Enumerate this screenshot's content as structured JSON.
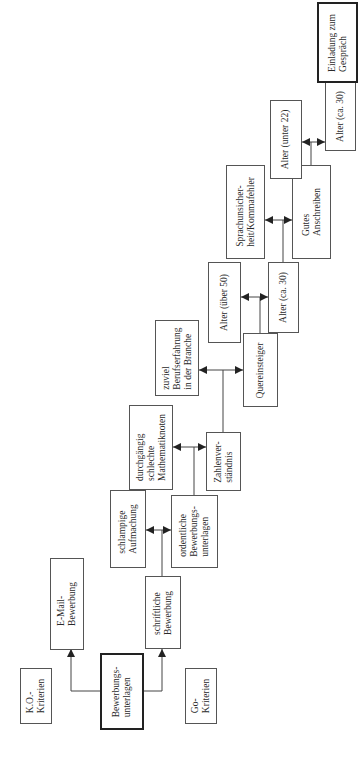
{
  "diagram": {
    "orientation": "rotated-90-ccw",
    "colors": {
      "line": "#444444",
      "box_border": "#555555",
      "background": "#ffffff"
    },
    "nodes": [
      {
        "id": "ko",
        "label": "K.O.-\nKriterien",
        "x": 20,
        "y": 668,
        "w": 32,
        "h": 56,
        "thick": false
      },
      {
        "id": "unterlagen",
        "label": "Bewerbungs-\nunterlagen",
        "x": 100,
        "y": 653,
        "w": 44,
        "h": 77,
        "thick": true
      },
      {
        "id": "email",
        "label": "E-Mail-\nBewerbung",
        "x": 50,
        "y": 558,
        "w": 34,
        "h": 92,
        "thick": false
      },
      {
        "id": "schriftlich",
        "label": "schriftliche\nBewerbung",
        "x": 145,
        "y": 576,
        "w": 36,
        "h": 73,
        "thick": false
      },
      {
        "id": "go",
        "label": "Go-\nKriterien",
        "x": 185,
        "y": 668,
        "w": 32,
        "h": 56,
        "thick": false
      },
      {
        "id": "schlampig",
        "label": "schlampige\nAufmachung",
        "x": 110,
        "y": 490,
        "w": 36,
        "h": 78,
        "thick": false
      },
      {
        "id": "ordentlich",
        "label": "ordentliche\nBewerbungs-\nunterlagen",
        "x": 171,
        "y": 495,
        "w": 47,
        "h": 73,
        "thick": false
      },
      {
        "id": "mathe",
        "label": "durchgängig\nschlechte\nMathematiknoten",
        "x": 129,
        "y": 405,
        "w": 44,
        "h": 85,
        "thick": false
      },
      {
        "id": "zahlen",
        "label": "Zahlenver-\nständnis",
        "x": 206,
        "y": 432,
        "w": 35,
        "h": 59,
        "thick": false
      },
      {
        "id": "beruf",
        "label": "zuviel\nBerufserfahrung\nin der Branche",
        "x": 155,
        "y": 320,
        "w": 44,
        "h": 76,
        "thick": false
      },
      {
        "id": "quer",
        "label": "Quereinsteiger",
        "x": 243,
        "y": 333,
        "w": 35,
        "h": 74,
        "thick": false
      },
      {
        "id": "alter50",
        "label": "Alter (über 50)",
        "x": 208,
        "y": 262,
        "w": 33,
        "h": 81,
        "thick": false
      },
      {
        "id": "alter30a",
        "label": "Alter (ca. 30)",
        "x": 268,
        "y": 262,
        "w": 31,
        "h": 71,
        "thick": false
      },
      {
        "id": "sprache",
        "label": "Sprachunsicher-\nheit/Kommafehler",
        "x": 226,
        "y": 165,
        "w": 39,
        "h": 94,
        "thick": false
      },
      {
        "id": "anschreiben",
        "label": "Gutes\nAnschreiben",
        "x": 292,
        "y": 165,
        "w": 39,
        "h": 94,
        "thick": false
      },
      {
        "id": "alter22",
        "label": "Alter (unter 22)",
        "x": 270,
        "y": 100,
        "w": 32,
        "h": 79,
        "thick": false
      },
      {
        "id": "alter30b",
        "label": "Alter (ca. 30)",
        "x": 325,
        "y": 82,
        "w": 31,
        "h": 69,
        "thick": false
      },
      {
        "id": "einladung",
        "label": "Einladung zum\nGespräch",
        "x": 317,
        "y": 2,
        "w": 41,
        "h": 81,
        "thick": true
      }
    ],
    "edges": [
      {
        "from": "unterlagen",
        "to": "email",
        "points": [
          [
            100,
            691
          ],
          [
            71,
            691
          ],
          [
            71,
            649
          ]
        ]
      },
      {
        "from": "unterlagen",
        "to": "schriftlich",
        "points": [
          [
            143,
            691
          ],
          [
            162,
            691
          ],
          [
            162,
            649
          ]
        ]
      },
      {
        "from": "schriftlich",
        "to": [
          "schlampig",
          "ordentlich"
        ],
        "stem": [
          [
            162,
            576
          ],
          [
            162,
            530
          ]
        ],
        "bar": [
          [
            146,
            530
          ],
          [
            171,
            530
          ]
        ]
      },
      {
        "from": "ordentlich",
        "to": [
          "mathe",
          "zahlen"
        ],
        "stem": [
          [
            194,
            495
          ],
          [
            194,
            447
          ]
        ],
        "bar": [
          [
            173,
            447
          ],
          [
            206,
            447
          ]
        ]
      },
      {
        "from": "zahlen",
        "to": [
          "beruf",
          "quer"
        ],
        "stem": [
          [
            223,
            432
          ],
          [
            223,
            370
          ]
        ],
        "bar": [
          [
            199,
            370
          ],
          [
            243,
            370
          ]
        ]
      },
      {
        "from": "quer",
        "to": [
          "alter50",
          "alter30a"
        ],
        "stem": [
          [
            260,
            333
          ],
          [
            260,
            297
          ]
        ],
        "bar": [
          [
            241,
            297
          ],
          [
            268,
            297
          ]
        ]
      },
      {
        "from": "alter30a",
        "to": [
          "sprache",
          "anschreiben"
        ],
        "stem": [
          [
            283,
            262
          ],
          [
            283,
            220
          ]
        ],
        "bar": [
          [
            265,
            220
          ],
          [
            292,
            220
          ]
        ]
      },
      {
        "from": "anschreiben",
        "to": [
          "alter22",
          "alter30b"
        ],
        "stem": [
          [
            311,
            165
          ],
          [
            311,
            142
          ]
        ],
        "bar": [
          [
            302,
            142
          ],
          [
            325,
            142
          ]
        ]
      },
      {
        "from": "alter30b",
        "to": "einladung",
        "points": [
          [
            340,
            82
          ],
          [
            340,
            83
          ]
        ]
      }
    ]
  }
}
